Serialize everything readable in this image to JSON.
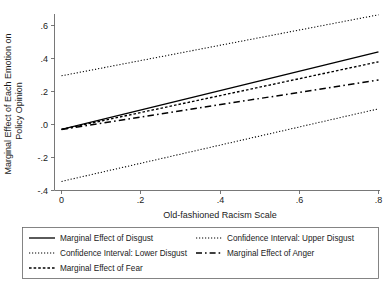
{
  "chart_data": {
    "type": "line",
    "title": "",
    "xlabel": "Old-fashioned Racism Scale",
    "ylabel": "Marginal Effect of Each Emotion on Policy Opinion",
    "xlim": [
      0,
      0.8
    ],
    "ylim": [
      -0.4,
      0.7
    ],
    "xticks": [
      0,
      0.2,
      0.4,
      0.6,
      0.8
    ],
    "xticklabels": [
      "0",
      ".2",
      ".4",
      ".6",
      ".8"
    ],
    "yticks": [
      -0.4,
      -0.2,
      0.0,
      0.2,
      0.4,
      0.6
    ],
    "yticklabels": [
      "-.4",
      "-.2",
      ".0",
      ".2",
      ".4",
      ".6"
    ],
    "grid": false,
    "legend_position": "below-plot",
    "x": [
      0,
      0.8
    ],
    "series": [
      {
        "name": "Marginal Effect of Disgust",
        "style": "solid",
        "values": [
          -0.03,
          0.44
        ]
      },
      {
        "name": "Confidence Interval: Upper Disgust",
        "style": "dotted",
        "values": [
          0.295,
          0.665
        ]
      },
      {
        "name": "Confidence Interval: Lower Disgust",
        "style": "dotted",
        "values": [
          -0.345,
          0.095
        ]
      },
      {
        "name": "Marginal Effect of Anger",
        "style": "dash-dot",
        "values": [
          -0.03,
          0.27
        ]
      },
      {
        "name": "Marginal Effect of Fear",
        "style": "dashed-fine",
        "values": [
          -0.03,
          0.38
        ]
      }
    ]
  },
  "axes": {
    "x_title": "Old-fashioned Racism Scale",
    "y_title_line1": "Marginal Effect of Each Emotion on",
    "y_title_line2": "Policy Opinion",
    "x_tick_labels": [
      "0",
      ".2",
      ".4",
      ".6",
      ".8"
    ],
    "y_tick_labels": [
      ".6",
      ".4",
      ".2",
      ".0",
      "-.2",
      "-.4"
    ]
  },
  "legend": {
    "entries": [
      {
        "label": "Marginal Effect of Disgust",
        "style": "solid"
      },
      {
        "label": "Confidence Interval: Upper Disgust",
        "style": "dotted"
      },
      {
        "label": "Confidence Interval: Lower Disgust",
        "style": "dotted"
      },
      {
        "label": "Marginal Effect of Anger",
        "style": "dash-dot"
      },
      {
        "label": "Marginal Effect of Fear",
        "style": "dashed-fine"
      }
    ]
  },
  "colors": {
    "line": "#000000",
    "axis": "#555555",
    "legend_border": "#666666",
    "background": "#ffffff"
  }
}
